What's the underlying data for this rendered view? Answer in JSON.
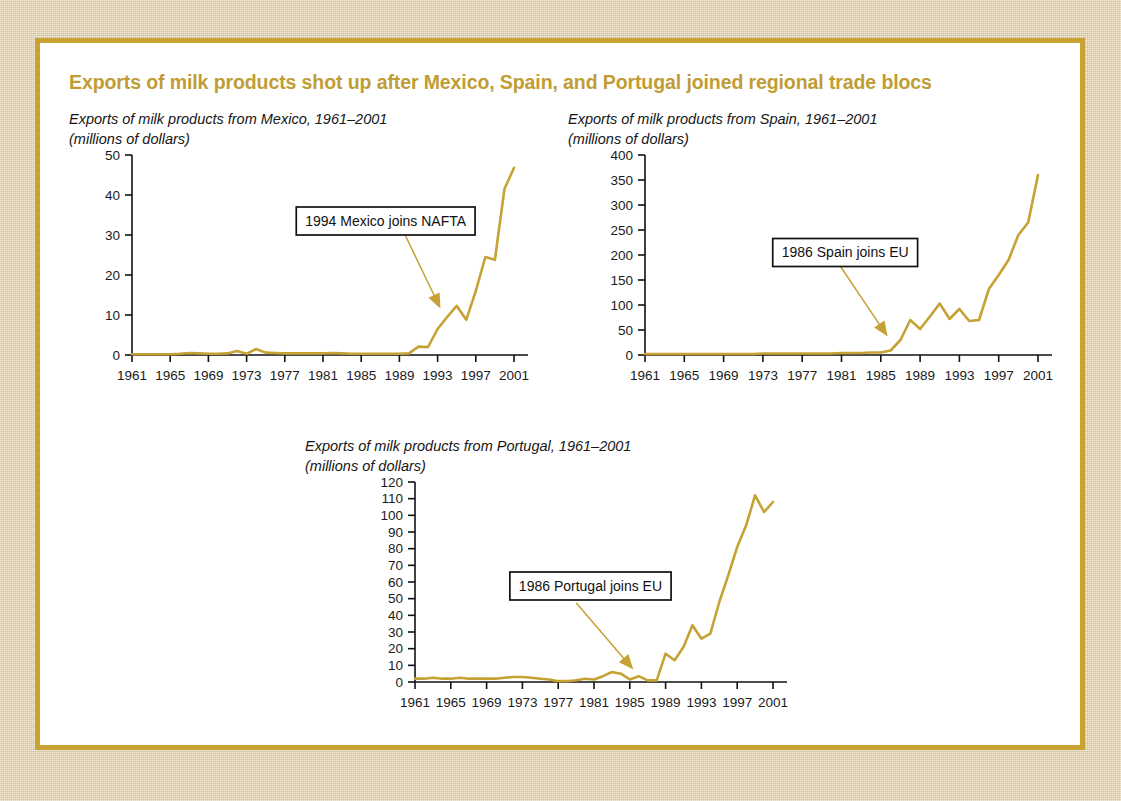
{
  "figure": {
    "title": "Exports of milk products shot up after Mexico, Spain, and Portugal joined regional trade blocs",
    "title_color": "#bf9d34",
    "line_color": "#c5a233",
    "panel_background": "#ffffff",
    "page_background": "#e2d2ad",
    "border_color": "#c9a233"
  },
  "chart_data": [
    {
      "id": "mexico",
      "type": "line",
      "title": "Exports of milk products from Mexico, 1961–2001",
      "subtitle": "(millions of dollars)",
      "xlabel": "",
      "ylabel": "millions of dollars",
      "xlim": [
        1961,
        2001
      ],
      "ylim": [
        0,
        50
      ],
      "yticks": [
        0,
        10,
        20,
        30,
        40,
        50
      ],
      "ytick_labels": [
        "0",
        "10",
        "20",
        "30",
        "40",
        "50"
      ],
      "xticks": [
        1961,
        1965,
        1969,
        1973,
        1977,
        1981,
        1985,
        1989,
        1993,
        1997,
        2001
      ],
      "xtick_labels": [
        "1961",
        "1965",
        "1969",
        "1973",
        "1977",
        "1981",
        "1985",
        "1989",
        "1993",
        "1997",
        "2001"
      ],
      "grid": false,
      "legend": null,
      "annotation": {
        "text": "1994 Mexico joins NAFTA",
        "box_x": 1978.2,
        "box_y": 37.0,
        "arrow_from_x": 1989.6,
        "arrow_from_y": 30.0,
        "arrow_to_x": 1993.3,
        "arrow_to_y": 11.6
      },
      "x": [
        1961,
        1962,
        1963,
        1964,
        1965,
        1966,
        1967,
        1968,
        1969,
        1970,
        1971,
        1972,
        1973,
        1974,
        1975,
        1976,
        1977,
        1978,
        1979,
        1980,
        1981,
        1982,
        1983,
        1984,
        1985,
        1986,
        1987,
        1988,
        1989,
        1990,
        1991,
        1992,
        1993,
        1994,
        1995,
        1996,
        1997,
        1998,
        1999,
        2000,
        2001
      ],
      "values": [
        0.2,
        0.2,
        0.2,
        0.2,
        0.2,
        0.3,
        0.5,
        0.4,
        0.3,
        0.3,
        0.4,
        1.0,
        0.3,
        1.5,
        0.6,
        0.5,
        0.4,
        0.4,
        0.4,
        0.4,
        0.4,
        0.5,
        0.4,
        0.3,
        0.3,
        0.3,
        0.3,
        0.3,
        0.3,
        0.4,
        2.1,
        2.0,
        6.5,
        9.5,
        12.3,
        8.8,
        16.0,
        24.5,
        23.8,
        41.5,
        46.8
      ]
    },
    {
      "id": "spain",
      "type": "line",
      "title": "Exports of milk products from Spain, 1961–2001",
      "subtitle": "(millions of dollars)",
      "xlabel": "",
      "ylabel": "millions of dollars",
      "xlim": [
        1961,
        2001
      ],
      "ylim": [
        0,
        400
      ],
      "yticks": [
        0,
        50,
        100,
        150,
        200,
        250,
        300,
        350,
        400
      ],
      "ytick_labels": [
        "0",
        "50",
        "100",
        "150",
        "200",
        "250",
        "300",
        "350",
        "400"
      ],
      "xticks": [
        1961,
        1965,
        1969,
        1973,
        1977,
        1981,
        1985,
        1989,
        1993,
        1997,
        2001
      ],
      "xtick_labels": [
        "1961",
        "1965",
        "1969",
        "1973",
        "1977",
        "1981",
        "1985",
        "1989",
        "1993",
        "1997",
        "2001"
      ],
      "grid": false,
      "legend": null,
      "annotation": {
        "text": "1986 Spain joins EU",
        "box_x": 1974.0,
        "box_y": 233.0,
        "arrow_from_x": 1980.9,
        "arrow_from_y": 177.0,
        "arrow_to_x": 1985.7,
        "arrow_to_y": 37.0
      },
      "x": [
        1961,
        1962,
        1963,
        1964,
        1965,
        1966,
        1967,
        1968,
        1969,
        1970,
        1971,
        1972,
        1973,
        1974,
        1975,
        1976,
        1977,
        1978,
        1979,
        1980,
        1981,
        1982,
        1983,
        1984,
        1985,
        1986,
        1987,
        1988,
        1989,
        1990,
        1991,
        1992,
        1993,
        1994,
        1995,
        1996,
        1997,
        1998,
        1999,
        2000,
        2001
      ],
      "values": [
        2,
        2,
        2,
        2,
        2,
        2,
        2,
        2,
        2,
        2,
        2,
        2,
        3,
        3,
        3,
        3,
        3,
        3,
        3,
        3,
        4,
        4,
        4,
        5,
        5,
        9,
        30,
        70,
        52,
        77,
        103,
        72,
        92,
        68,
        70,
        132,
        160,
        190,
        240,
        265,
        360
      ]
    },
    {
      "id": "portugal",
      "type": "line",
      "title": "Exports of milk products from Portugal, 1961–2001",
      "subtitle": "(millions of dollars)",
      "xlabel": "",
      "ylabel": "millions of dollars",
      "xlim": [
        1961,
        2001
      ],
      "ylim": [
        0,
        120
      ],
      "yticks": [
        0,
        10,
        20,
        30,
        40,
        50,
        60,
        70,
        80,
        90,
        100,
        110,
        120
      ],
      "ytick_labels": [
        "0",
        "10",
        "20",
        "30",
        "40",
        "50",
        "60",
        "70",
        "80",
        "90",
        "100",
        "110",
        "120"
      ],
      "xticks": [
        1961,
        1965,
        1969,
        1973,
        1977,
        1981,
        1985,
        1989,
        1993,
        1997,
        2001
      ],
      "xtick_labels": [
        "1961",
        "1965",
        "1969",
        "1973",
        "1977",
        "1981",
        "1985",
        "1989",
        "1993",
        "1997",
        "2001"
      ],
      "grid": false,
      "legend": null,
      "annotation": {
        "text": "1986 Portugal joins EU",
        "box_x": 1971.6,
        "box_y": 66.0,
        "arrow_from_x": 1979.0,
        "arrow_from_y": 47.5,
        "arrow_to_x": 1985.4,
        "arrow_to_y": 7.5
      },
      "x": [
        1961,
        1962,
        1963,
        1964,
        1965,
        1966,
        1967,
        1968,
        1969,
        1970,
        1971,
        1972,
        1973,
        1974,
        1975,
        1976,
        1977,
        1978,
        1979,
        1980,
        1981,
        1982,
        1983,
        1984,
        1985,
        1986,
        1987,
        1988,
        1989,
        1990,
        1991,
        1992,
        1993,
        1994,
        1995,
        1996,
        1997,
        1998,
        1999,
        2000,
        2001
      ],
      "values": [
        2,
        2,
        2.5,
        2,
        2,
        2.5,
        2,
        2,
        2,
        2,
        2.5,
        3,
        3,
        2.5,
        2,
        1.5,
        0.5,
        0.5,
        1,
        2,
        1.5,
        3.5,
        6,
        5,
        1.5,
        3.5,
        1,
        1,
        17,
        13,
        21,
        34,
        26,
        29,
        48,
        64,
        81,
        94,
        112,
        102,
        108
      ]
    }
  ]
}
